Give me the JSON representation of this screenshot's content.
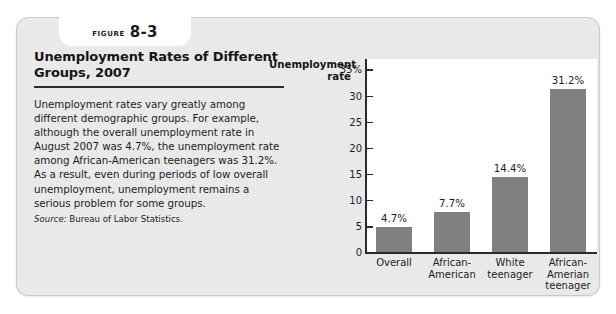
{
  "figure": {
    "tab_word": "FIGURE",
    "tab_number": "8-3",
    "title": "Unemployment Rates of Different Groups, 2007",
    "body": "Unemployment rates vary greatly among different demographic groups. For example, although the overall unemployment rate in August 2007 was 4.7%, the unemployment rate among African-American teenagers was 31.2%. As a result, even during periods of low overall unemployment, unemployment remains a serious problem for some groups.",
    "source_label": "Source:",
    "source_text": "Bureau of Labor Statistics."
  },
  "chart_data": {
    "type": "bar",
    "title": "Unemployment Rates of Different Groups, 2007",
    "xlabel": "",
    "ylabel": "Unemployment rate",
    "ylim": [
      0,
      37
    ],
    "yticks": [
      0,
      5,
      10,
      15,
      20,
      25,
      30,
      35
    ],
    "ytick_labels": [
      "0",
      "5",
      "10",
      "15",
      "20",
      "25",
      "30",
      "35%"
    ],
    "grid": false,
    "legend": "none",
    "categories": [
      "Overall",
      "African-American",
      "White teenager",
      "African-Amerian teenager"
    ],
    "category_lines": [
      [
        "Overall"
      ],
      [
        "African-",
        "American"
      ],
      [
        "White",
        "teenager"
      ],
      [
        "African-",
        "Amerian",
        "teenager"
      ]
    ],
    "values": [
      4.7,
      7.7,
      14.4,
      31.2
    ],
    "value_labels": [
      "4.7%",
      "7.7%",
      "14.4%",
      "31.2%"
    ],
    "bar_color": "#808080",
    "plot_background": "#ffffff",
    "axis_color": "#2b2b2b"
  },
  "theme": {
    "card_background": "#e9e9e9",
    "card_border": "#c9c9c9",
    "text_color": "#1d1d1d",
    "rule_color": "#2b2b2b"
  }
}
